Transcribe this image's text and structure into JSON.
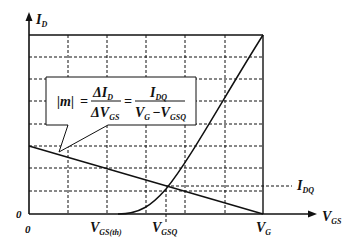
{
  "diagram": {
    "axes": {
      "y_label_main": "I",
      "y_label_sub": "D",
      "x_label_main": "V",
      "x_label_sub": "GS",
      "y_origin_label": "0",
      "x_origin_label": "0"
    },
    "x_ticks": [
      {
        "main": "V",
        "sub": "GS(th)"
      },
      {
        "main": "V",
        "sub": "GSQ"
      },
      {
        "main": "V",
        "sub": "G"
      }
    ],
    "right_labels": [
      {
        "main": "I",
        "sub": "DQ"
      }
    ],
    "formula": {
      "lhs": "|m|",
      "eq1": "=",
      "frac1_num_main": "ΔI",
      "frac1_num_sub": "D",
      "frac1_den_main": "ΔV",
      "frac1_den_sub": "GS",
      "eq2": "=",
      "frac2_num_main": "I",
      "frac2_num_sub": "DQ",
      "frac2_den_a_main": "V",
      "frac2_den_a_sub": "G",
      "frac2_den_minus": "−",
      "frac2_den_b_main": "V",
      "frac2_den_b_sub": "GSQ"
    },
    "curves": [
      {
        "name": "transfer-curve",
        "description": "I_D rises quadratically from V_GS(th)"
      },
      {
        "name": "load-line",
        "description": "straight line from (0, V_G/R) down to V_G on V_GS axis"
      }
    ],
    "q_point": {
      "label_x": "V_GSQ",
      "label_y": "I_DQ"
    }
  }
}
